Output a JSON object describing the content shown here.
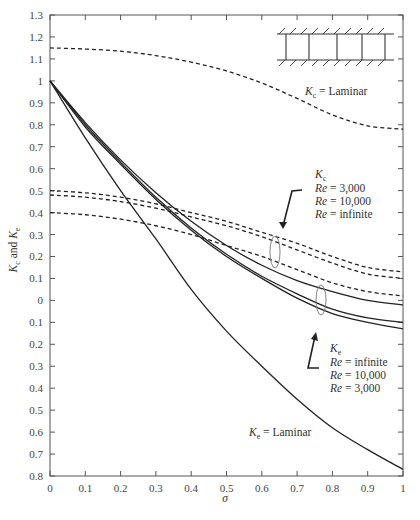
{
  "chart_data": {
    "type": "line",
    "title": "",
    "xlabel": "σ",
    "ylabel": "Kc and Ke",
    "ylabel_parts": {
      "k1": "K",
      "s1": "c",
      "mid": " and ",
      "k2": "K",
      "s2": "e"
    },
    "xlim": [
      0,
      1
    ],
    "ylim": [
      -0.8,
      1.3
    ],
    "grid": false,
    "x_ticks": [
      0,
      0.1,
      0.2,
      0.3,
      0.4,
      0.5,
      0.6,
      0.7,
      0.8,
      0.9,
      1
    ],
    "x_tick_labels": [
      "0",
      "0.1",
      "0.2",
      "0.3",
      "0.4",
      "0.5",
      "0.6",
      "0.7",
      "0.8",
      "0.9",
      "1"
    ],
    "y_ticks": [
      1.3,
      1.2,
      1.1,
      1.0,
      0.9,
      0.8,
      0.7,
      0.6,
      0.5,
      0.4,
      0.3,
      0.2,
      0.1,
      0,
      -0.1,
      -0.2,
      -0.3,
      -0.4,
      -0.5,
      -0.6,
      -0.7,
      -0.8
    ],
    "y_tick_labels": [
      "1.3",
      "1.2",
      "1.1",
      "1",
      "0.9",
      "0.8",
      "0.7",
      "0.6",
      "0.5",
      "0.4",
      "0.3",
      "0.2",
      "0.1",
      "0",
      "0.1",
      "0.2",
      "0.3",
      "0.4",
      "0.5",
      "0.6",
      "0.7",
      "0.8"
    ],
    "series": [
      {
        "name": "Kc Laminar",
        "style": "dashed",
        "x": [
          0,
          0.1,
          0.2,
          0.3,
          0.4,
          0.5,
          0.6,
          0.7,
          0.8,
          0.9,
          1.0
        ],
        "y": [
          1.15,
          1.145,
          1.135,
          1.115,
          1.085,
          1.045,
          0.99,
          0.92,
          0.845,
          0.795,
          0.78
        ]
      },
      {
        "name": "Kc Re = 3,000",
        "style": "dashed",
        "x": [
          0,
          0.1,
          0.2,
          0.3,
          0.4,
          0.5,
          0.6,
          0.7,
          0.8,
          0.9,
          1.0
        ],
        "y": [
          0.5,
          0.49,
          0.47,
          0.44,
          0.4,
          0.36,
          0.31,
          0.26,
          0.2,
          0.15,
          0.13
        ]
      },
      {
        "name": "Kc Re = 10,000",
        "style": "dashed",
        "x": [
          0,
          0.1,
          0.2,
          0.3,
          0.4,
          0.5,
          0.6,
          0.7,
          0.8,
          0.9,
          1.0
        ],
        "y": [
          0.48,
          0.47,
          0.45,
          0.42,
          0.38,
          0.34,
          0.29,
          0.23,
          0.17,
          0.12,
          0.1
        ]
      },
      {
        "name": "Kc Re = infinite",
        "style": "dashed",
        "x": [
          0,
          0.1,
          0.2,
          0.3,
          0.4,
          0.5,
          0.6,
          0.7,
          0.8,
          0.9,
          1.0
        ],
        "y": [
          0.4,
          0.39,
          0.37,
          0.34,
          0.3,
          0.25,
          0.2,
          0.14,
          0.08,
          0.04,
          0.02
        ]
      },
      {
        "name": "Ke Re = infinite",
        "style": "solid",
        "x": [
          0,
          0.1,
          0.2,
          0.3,
          0.4,
          0.5,
          0.6,
          0.7,
          0.8,
          0.9,
          1.0
        ],
        "y": [
          1.0,
          0.81,
          0.64,
          0.49,
          0.36,
          0.25,
          0.16,
          0.09,
          0.04,
          0.0,
          -0.02
        ]
      },
      {
        "name": "Ke Re = 10,000",
        "style": "solid",
        "x": [
          0,
          0.1,
          0.2,
          0.3,
          0.4,
          0.5,
          0.6,
          0.7,
          0.8,
          0.9,
          1.0
        ],
        "y": [
          1.0,
          0.8,
          0.63,
          0.47,
          0.33,
          0.21,
          0.11,
          0.03,
          -0.04,
          -0.08,
          -0.1
        ]
      },
      {
        "name": "Ke Re = 3,000",
        "style": "solid",
        "x": [
          0,
          0.1,
          0.2,
          0.3,
          0.4,
          0.5,
          0.6,
          0.7,
          0.8,
          0.9,
          1.0
        ],
        "y": [
          1.0,
          0.79,
          0.62,
          0.46,
          0.32,
          0.2,
          0.1,
          0.01,
          -0.06,
          -0.1,
          -0.13
        ]
      },
      {
        "name": "Ke Laminar",
        "style": "solid",
        "x": [
          0,
          0.1,
          0.2,
          0.3,
          0.4,
          0.5,
          0.6,
          0.7,
          0.8,
          0.9,
          1.0
        ],
        "y": [
          1.0,
          0.74,
          0.5,
          0.28,
          0.05,
          -0.14,
          -0.3,
          -0.45,
          -0.58,
          -0.68,
          -0.77
        ]
      }
    ],
    "annotations": {
      "kc_laminar": {
        "k": "K",
        "sub": "c",
        "text": " = Laminar"
      },
      "ke_laminar": {
        "k": "K",
        "sub": "e",
        "text": " = Laminar"
      },
      "kc_group": {
        "k": "K",
        "sub": "c",
        "lines": [
          "Re = 3,000",
          "Re = 10,000",
          "Re = infinite"
        ]
      },
      "ke_group": {
        "k": "K",
        "sub": "e",
        "lines": [
          "Re = infinite",
          "Re = 10,000",
          "Re = 3,000"
        ]
      },
      "re_prefix": "Re",
      "kc_group_values": [
        " = 3,000",
        " = 10,000",
        " = infinite"
      ],
      "ke_group_values": [
        " = infinite",
        " = 10,000",
        " = 3,000"
      ]
    },
    "inset": "heat exchanger core schematic (parallel plates with channels)"
  }
}
